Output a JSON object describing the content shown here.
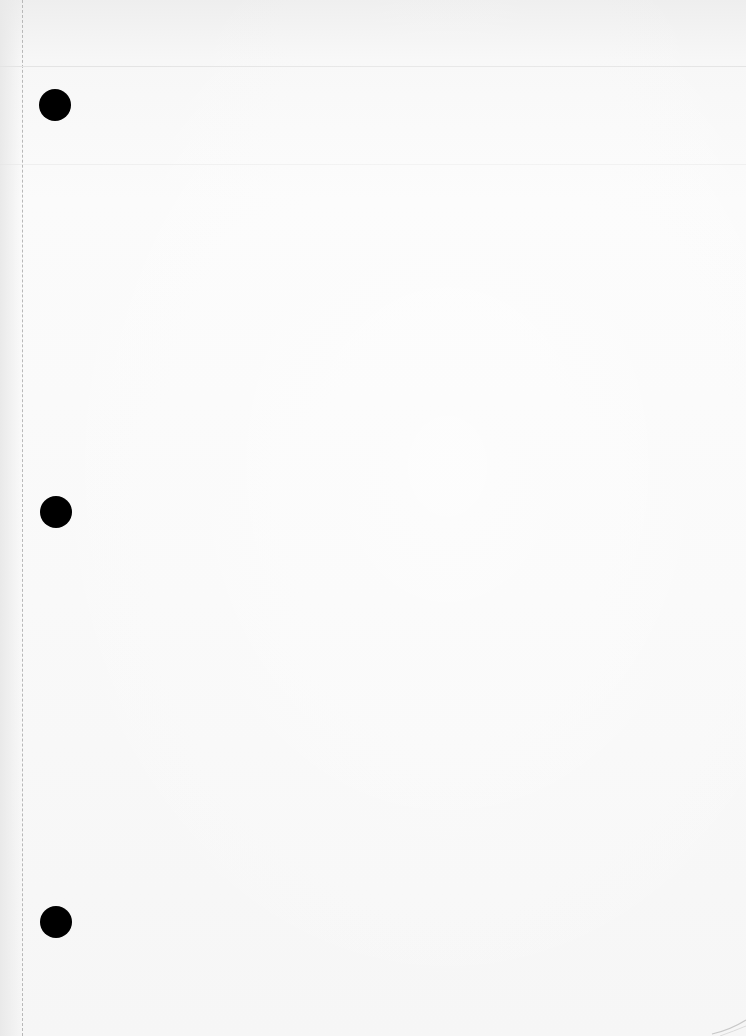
{
  "document": {
    "type": "blank loose-leaf page",
    "text_content": "",
    "punch_holes": [
      {
        "name": "top",
        "left": 39,
        "top": 89
      },
      {
        "name": "middle",
        "left": 40,
        "top": 496
      },
      {
        "name": "bottom",
        "left": 40,
        "top": 906
      }
    ],
    "colors": {
      "paper": "#f9f9f9",
      "hole": "#000000",
      "perforation": "#b8b8b8",
      "rule": "#e4e4e4"
    }
  }
}
